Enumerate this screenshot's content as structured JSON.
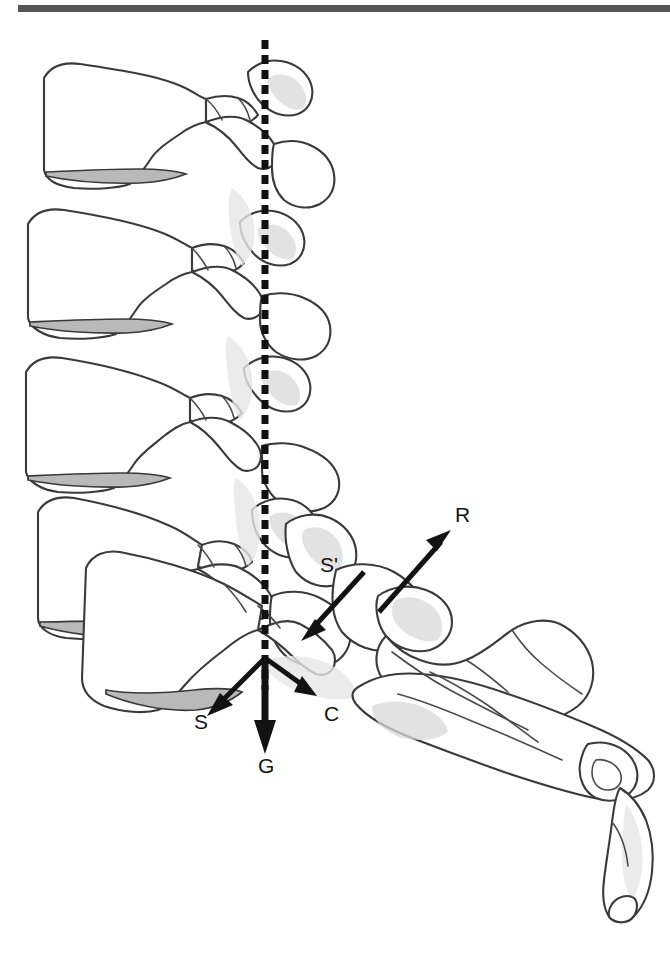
{
  "figure": {
    "kind": "anatomical-line-drawing",
    "view": "lateral",
    "background_color": "#ffffff",
    "outline_color": "#3a3a3a",
    "shading_color": "#b9b9b9",
    "vector_color": "#121212"
  },
  "top_rule": {
    "name": "horizontal-rule",
    "color": "#555555",
    "x": 18,
    "y": 5,
    "width": 652,
    "height": 7
  },
  "plumb_line": {
    "name": "gravity-plumb-line",
    "style": "dashed",
    "color": "#111111",
    "x": 265,
    "y_start": 40,
    "y_end": 690,
    "dash_length": 9,
    "gap_length": 6,
    "stroke_width": 7
  },
  "vectors": [
    {
      "id": "R",
      "label": "R",
      "meaning": "reaction force",
      "label_x": 455,
      "label_y": 522,
      "x1": 379,
      "y1": 612,
      "x2": 449,
      "y2": 533,
      "stroke_width": 5,
      "color": "#121212"
    },
    {
      "id": "S-prime",
      "label": "S'",
      "meaning": "shear at sacral endplate",
      "label_x": 320,
      "label_y": 572,
      "x1": 364,
      "y1": 572,
      "x2": 303,
      "y2": 639,
      "stroke_width": 5,
      "color": "#121212"
    },
    {
      "id": "S",
      "label": "S",
      "meaning": "shear force",
      "label_x": 194,
      "label_y": 729,
      "x1": 265,
      "y1": 658,
      "x2": 209,
      "y2": 714,
      "stroke_width": 5,
      "color": "#121212"
    },
    {
      "id": "C",
      "label": "C",
      "meaning": "compression force",
      "label_x": 324,
      "label_y": 721,
      "x1": 265,
      "y1": 658,
      "x2": 315,
      "y2": 694,
      "stroke_width": 5,
      "color": "#121212"
    },
    {
      "id": "G",
      "label": "G",
      "meaning": "gravity / body weight",
      "label_x": 258,
      "label_y": 773,
      "x1": 265,
      "y1": 658,
      "x2": 265,
      "y2": 752,
      "stroke_width": 7,
      "color": "#121212"
    }
  ],
  "vertebrae": [
    {
      "name": "lumbar-vertebra-1",
      "order": 1
    },
    {
      "name": "lumbar-vertebra-2",
      "order": 2
    },
    {
      "name": "lumbar-vertebra-3",
      "order": 3
    },
    {
      "name": "lumbar-vertebra-4",
      "order": 4
    },
    {
      "name": "lumbar-vertebra-5",
      "order": 5
    }
  ],
  "sacrum": {
    "name": "sacrum-coccyx",
    "order": 6
  }
}
